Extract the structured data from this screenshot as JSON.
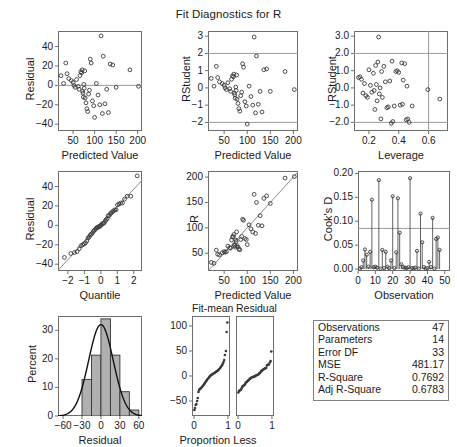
{
  "title": "Fit Diagnostics for R",
  "colors": {
    "frame": "#6e6e6e",
    "marker": "#3a3a3a",
    "refline": "#9a9a9a",
    "fitline": "#8a8a8a",
    "histbar": "#b0b0b0",
    "histedge": "#333333",
    "curve": "#111111",
    "table_border": "#808080"
  },
  "stats_table": {
    "rows": [
      {
        "label": "Observations",
        "value": "47"
      },
      {
        "label": "Parameters",
        "value": "14"
      },
      {
        "label": "Error DF",
        "value": "33"
      },
      {
        "label": "MSE",
        "value": "481.17"
      },
      {
        "label": "R-Square",
        "value": "0.7692"
      },
      {
        "label": "Adj R-Square",
        "value": "0.6783"
      }
    ]
  },
  "chart_data": [
    {
      "id": "resid_vs_pred",
      "type": "scatter",
      "title": "",
      "xlabel": "Predicted Value",
      "ylabel": "Residual",
      "xlim": [
        15,
        210
      ],
      "ylim": [
        -47,
        56
      ],
      "xticks": [
        50,
        100,
        150,
        200
      ],
      "yticks": [
        -40,
        -20,
        0,
        20,
        40
      ],
      "reflines_h": [
        0
      ],
      "grid": false,
      "x": [
        22,
        28,
        33,
        36,
        40,
        46,
        50,
        52,
        55,
        58,
        62,
        64,
        66,
        68,
        70,
        71,
        72,
        73,
        74,
        75,
        76,
        77,
        78,
        80,
        82,
        84,
        86,
        88,
        90,
        92,
        95,
        98,
        100,
        104,
        108,
        112,
        115,
        118,
        120,
        124,
        128,
        132,
        136,
        142,
        150,
        182,
        202
      ],
      "y": [
        10,
        2,
        23,
        12,
        7,
        5,
        3,
        0,
        -2,
        6,
        -1,
        -4,
        10,
        14,
        13,
        16,
        -6,
        -8,
        -12,
        1,
        -3,
        15,
        -13,
        -18,
        -24,
        -27,
        -9,
        -5,
        27,
        23,
        -16,
        -21,
        -33,
        2,
        -10,
        -20,
        51,
        -29,
        30,
        -19,
        -4,
        -28,
        22,
        21,
        -2,
        16,
        -1
      ]
    },
    {
      "id": "rstudent_vs_pred",
      "type": "scatter",
      "title": "",
      "xlabel": "Predicted Value",
      "ylabel": "RStudent",
      "xlim": [
        15,
        210
      ],
      "ylim": [
        -2.5,
        3.3
      ],
      "xticks": [
        50,
        100,
        150,
        200
      ],
      "yticks": [
        -2,
        -1,
        0,
        1,
        2,
        3
      ],
      "reflines_h": [
        -2,
        2
      ],
      "grid": false,
      "x": [
        22,
        28,
        33,
        36,
        40,
        46,
        50,
        52,
        55,
        58,
        62,
        64,
        66,
        68,
        70,
        71,
        72,
        73,
        74,
        75,
        76,
        77,
        78,
        80,
        82,
        84,
        86,
        88,
        90,
        92,
        95,
        98,
        100,
        104,
        108,
        112,
        115,
        118,
        120,
        124,
        128,
        132,
        136,
        142,
        150,
        182,
        202
      ],
      "y": [
        0.55,
        0.1,
        1.25,
        0.6,
        0.35,
        0.25,
        0.15,
        0.0,
        -0.1,
        0.3,
        -0.05,
        -0.2,
        0.5,
        0.7,
        0.65,
        0.8,
        -0.3,
        -0.4,
        -0.6,
        0.05,
        -0.15,
        0.75,
        -0.65,
        -0.9,
        -1.2,
        -1.35,
        -0.45,
        -0.25,
        1.4,
        1.2,
        -0.8,
        -1.05,
        -2.1,
        0.1,
        -0.5,
        -1.0,
        2.95,
        -1.45,
        1.85,
        -0.95,
        -0.2,
        -1.4,
        1.05,
        1.1,
        -0.2,
        0.95,
        -0.1
      ]
    },
    {
      "id": "rstudent_vs_leverage",
      "type": "scatter",
      "title": "",
      "xlabel": "Leverage",
      "ylabel": "RStudent",
      "xlim": [
        0.1,
        0.73
      ],
      "ylim": [
        -2.5,
        3.3
      ],
      "xticks": [
        0.2,
        0.4,
        0.6
      ],
      "yticks": [
        -2,
        -1,
        0,
        1,
        2,
        3
      ],
      "reflines_h": [
        -2,
        2
      ],
      "reflines_v": [
        0.6
      ],
      "grid": false,
      "x": [
        0.13,
        0.14,
        0.15,
        0.16,
        0.17,
        0.18,
        0.19,
        0.2,
        0.21,
        0.22,
        0.23,
        0.235,
        0.24,
        0.245,
        0.25,
        0.255,
        0.26,
        0.265,
        0.27,
        0.275,
        0.28,
        0.285,
        0.29,
        0.3,
        0.31,
        0.32,
        0.33,
        0.34,
        0.35,
        0.355,
        0.36,
        0.37,
        0.38,
        0.39,
        0.4,
        0.41,
        0.42,
        0.425,
        0.43,
        0.44,
        0.45,
        0.455,
        0.46,
        0.47,
        0.49,
        0.595,
        0.675
      ],
      "y": [
        0.6,
        0.65,
        0.5,
        -0.3,
        0.25,
        -0.45,
        -0.55,
        1.05,
        0.15,
        -0.25,
        0.85,
        -0.15,
        -1.25,
        1.3,
        0.2,
        -0.75,
        1.5,
        2.95,
        -0.35,
        0.0,
        -1.8,
        0.95,
        -0.55,
        1.25,
        0.35,
        -1.15,
        -1.1,
        0.4,
        -2.05,
        1.55,
        -1.95,
        -1.05,
        0.95,
        1.0,
        0.9,
        -1.0,
        1.45,
        -0.95,
        0.45,
        1.4,
        -1.85,
        0.1,
        -1.8,
        -2.0,
        -1.05,
        -0.1,
        -0.65
      ]
    },
    {
      "id": "qq_residual",
      "type": "scatter",
      "title": "",
      "xlabel": "Quantile",
      "ylabel": "Residual",
      "xlim": [
        -2.6,
        2.5
      ],
      "ylim": [
        -47,
        56
      ],
      "xticks": [
        -2,
        -1,
        0,
        1,
        2
      ],
      "yticks": [
        -40,
        -20,
        0,
        20,
        40
      ],
      "fitline": true,
      "grid": false,
      "x": [
        -2.21,
        -1.82,
        -1.6,
        -1.44,
        -1.31,
        -1.2,
        -1.1,
        -1.01,
        -0.93,
        -0.85,
        -0.78,
        -0.71,
        -0.64,
        -0.58,
        -0.51,
        -0.45,
        -0.39,
        -0.33,
        -0.28,
        -0.22,
        -0.16,
        -0.11,
        -0.05,
        0.0,
        0.05,
        0.11,
        0.16,
        0.22,
        0.28,
        0.33,
        0.39,
        0.45,
        0.51,
        0.58,
        0.64,
        0.71,
        0.78,
        0.85,
        0.93,
        1.01,
        1.1,
        1.2,
        1.31,
        1.44,
        1.6,
        1.82,
        2.21
      ],
      "y": [
        -33,
        -29,
        -28,
        -27,
        -24,
        -21,
        -20,
        -19,
        -18,
        -16,
        -13,
        -12,
        -10,
        -9,
        -8,
        -6,
        -5,
        -4,
        -3,
        -2,
        -2,
        -1,
        -1,
        0,
        1,
        2,
        2,
        3,
        5,
        6,
        7,
        10,
        10,
        12,
        13,
        14,
        15,
        16,
        16,
        21,
        22,
        23,
        23,
        27,
        30,
        30,
        51
      ]
    },
    {
      "id": "observed_vs_pred",
      "type": "scatter",
      "title": "",
      "xlabel": "Predicted Value",
      "ylabel": "R",
      "xlim": [
        15,
        210
      ],
      "ylim": [
        15,
        212
      ],
      "xticks": [
        50,
        100,
        150,
        200
      ],
      "yticks": [
        50,
        100,
        150,
        200
      ],
      "fitline": true,
      "grid": false,
      "x": [
        22,
        28,
        33,
        36,
        40,
        46,
        50,
        52,
        55,
        58,
        62,
        64,
        66,
        68,
        70,
        71,
        72,
        73,
        74,
        75,
        76,
        77,
        78,
        80,
        82,
        84,
        86,
        88,
        90,
        92,
        95,
        98,
        100,
        104,
        108,
        112,
        115,
        118,
        120,
        124,
        128,
        132,
        136,
        142,
        150,
        182,
        202
      ],
      "y": [
        32,
        30,
        56,
        48,
        47,
        51,
        53,
        52,
        53,
        64,
        61,
        60,
        76,
        82,
        83,
        87,
        66,
        65,
        62,
        76,
        73,
        92,
        65,
        62,
        58,
        57,
        77,
        83,
        117,
        115,
        79,
        77,
        67,
        106,
        98,
        92,
        166,
        89,
        150,
        105,
        124,
        104,
        158,
        163,
        148,
        198,
        201
      ]
    },
    {
      "id": "cooks_d",
      "type": "bar",
      "title": "",
      "xlabel": "Observation",
      "ylabel": "Cook's D",
      "xlim": [
        0,
        53
      ],
      "ylim": [
        -0.004,
        0.205
      ],
      "xticks": [
        0,
        10,
        20,
        30,
        40,
        50
      ],
      "yticks": [
        0.0,
        0.05,
        0.1,
        0.15,
        0.2
      ],
      "reflines_h": [
        0.085
      ],
      "grid": false,
      "categories": [
        1,
        2,
        3,
        4,
        5,
        6,
        7,
        8,
        9,
        10,
        11,
        12,
        13,
        14,
        15,
        16,
        17,
        18,
        19,
        20,
        21,
        22,
        23,
        24,
        25,
        26,
        27,
        28,
        29,
        30,
        31,
        32,
        33,
        34,
        35,
        36,
        37,
        38,
        39,
        40,
        41,
        42,
        43,
        44,
        45,
        46,
        47
      ],
      "values": [
        0.001,
        0.004,
        0.018,
        0.041,
        0.03,
        0.005,
        0.036,
        0.145,
        0.004,
        0.005,
        0.003,
        0.186,
        0.001,
        0.04,
        0.002,
        0.036,
        0.005,
        0.002,
        0.018,
        0.152,
        0.002,
        0.035,
        0.148,
        0.076,
        0.01,
        0.004,
        0.003,
        0.002,
        0.004,
        0.19,
        0.002,
        0.002,
        0.003,
        0.038,
        0.001,
        0.116,
        0.056,
        0.004,
        0.001,
        0.002,
        0.015,
        0.004,
        0.107,
        0.001,
        0.063,
        0.066,
        0.04
      ]
    },
    {
      "id": "residual_histogram",
      "type": "bar",
      "title": "",
      "xlabel": "Residual",
      "ylabel": "Percent",
      "xlim": [
        -68,
        65
      ],
      "ylim": [
        0,
        35
      ],
      "xticks": [
        -60,
        -30,
        0,
        30,
        60
      ],
      "yticks": [
        0,
        10,
        20,
        30
      ],
      "grid": false,
      "bin_edges": [
        -45,
        -30,
        -15,
        0,
        15,
        30,
        45,
        60
      ],
      "values": [
        0.0,
        12.8,
        21.3,
        34.0,
        21.3,
        8.5,
        2.1
      ],
      "curve": {
        "mean": 0.0,
        "sd": 19.5,
        "peak": 32.0
      }
    },
    {
      "id": "fit_mean_qq",
      "type": "scatter",
      "title": "Fit-mean",
      "xlabel": "Proportion Less",
      "ylabel": "",
      "xlim": [
        -0.06,
        1.06
      ],
      "ylim": [
        -80,
        120
      ],
      "xticks": [
        0,
        1
      ],
      "yticks": [
        -50,
        0,
        50,
        100
      ],
      "grid": false,
      "x": [
        0.01,
        0.03,
        0.05,
        0.07,
        0.09,
        0.11,
        0.13,
        0.15,
        0.17,
        0.19,
        0.21,
        0.23,
        0.26,
        0.28,
        0.3,
        0.32,
        0.34,
        0.36,
        0.38,
        0.4,
        0.43,
        0.45,
        0.47,
        0.49,
        0.51,
        0.53,
        0.55,
        0.57,
        0.6,
        0.62,
        0.64,
        0.66,
        0.68,
        0.7,
        0.72,
        0.74,
        0.77,
        0.79,
        0.81,
        0.83,
        0.85,
        0.87,
        0.89,
        0.91,
        0.94,
        0.96,
        0.98
      ],
      "y": [
        -68,
        -64,
        -58,
        -56,
        -50,
        -44,
        -32,
        -28,
        -26,
        -25,
        -24,
        -22,
        -20,
        -18,
        -16,
        -14,
        -12,
        -10,
        -8,
        -6,
        -4,
        -2,
        0,
        1,
        2,
        3,
        4,
        5,
        6,
        7,
        8,
        9,
        10,
        11,
        12,
        14,
        16,
        18,
        20,
        22,
        25,
        28,
        32,
        42,
        50,
        88,
        107
      ]
    },
    {
      "id": "residual_qq",
      "type": "scatter",
      "title": "Residual",
      "xlabel": "",
      "ylabel": "",
      "xlim": [
        -0.06,
        1.06
      ],
      "ylim": [
        -80,
        120
      ],
      "xticks": [
        0,
        1
      ],
      "yticks": [],
      "grid": false,
      "x": [
        0.01,
        0.03,
        0.05,
        0.07,
        0.09,
        0.11,
        0.13,
        0.15,
        0.17,
        0.19,
        0.21,
        0.23,
        0.26,
        0.28,
        0.3,
        0.32,
        0.34,
        0.36,
        0.38,
        0.4,
        0.43,
        0.45,
        0.47,
        0.49,
        0.51,
        0.53,
        0.55,
        0.57,
        0.6,
        0.62,
        0.64,
        0.66,
        0.68,
        0.7,
        0.72,
        0.74,
        0.77,
        0.79,
        0.81,
        0.83,
        0.85,
        0.87,
        0.89,
        0.91,
        0.94,
        0.96,
        0.98
      ],
      "y": [
        -33,
        -30,
        -29,
        -28,
        -27,
        -24,
        -21,
        -20,
        -19,
        -18,
        -16,
        -13,
        -12,
        -10,
        -9,
        -8,
        -6,
        -5,
        -4,
        -3,
        -2,
        -2,
        -1,
        -1,
        0,
        1,
        2,
        2,
        3,
        5,
        6,
        7,
        10,
        10,
        12,
        13,
        14,
        15,
        16,
        16,
        21,
        22,
        23,
        23,
        27,
        30,
        49
      ]
    }
  ]
}
